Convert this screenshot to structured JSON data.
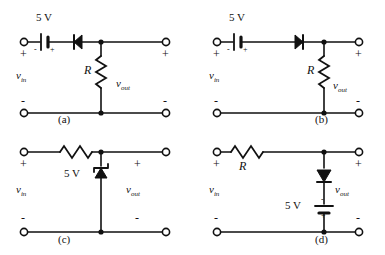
{
  "figure": {
    "title": "",
    "background_color": "#ffffff",
    "ink_color": "#111111",
    "panel_count": 4
  },
  "common_labels": {
    "v_in": "v",
    "v_in_sub": "in",
    "v_out": "v",
    "v_out_sub": "out",
    "resistor": "R",
    "source_value": "5 V",
    "plus": "+",
    "minus": "-",
    "battery_minus": "-",
    "battery_plus": "+"
  },
  "panels": [
    {
      "id": "a",
      "caption": "(a)",
      "source_label": "5 V",
      "resistor_label": "R",
      "input_label": "v",
      "input_sub": "in",
      "output_label": "v",
      "output_sub": "out",
      "input_plus": "+",
      "input_minus": "-",
      "output_plus": "+",
      "output_minus": "-",
      "battery_left_sign": "-",
      "battery_right_sign": "+",
      "elements": [
        "battery-series-horizontal",
        "diode-series-horizontal-pointing-left",
        "resistor-shunt-vertical"
      ]
    },
    {
      "id": "b",
      "caption": "(b)",
      "source_label": "5 V",
      "resistor_label": "R",
      "input_label": "v",
      "input_sub": "in",
      "output_label": "v",
      "output_sub": "out",
      "input_plus": "+",
      "input_minus": "-",
      "output_plus": "+",
      "output_minus": "-",
      "battery_left_sign": "-",
      "battery_right_sign": "+",
      "elements": [
        "battery-series-horizontal",
        "diode-series-horizontal-pointing-right",
        "resistor-shunt-vertical"
      ]
    },
    {
      "id": "c",
      "caption": "(c)",
      "source_label": "5 V",
      "resistor_label": "",
      "input_label": "v",
      "input_sub": "in",
      "output_label": "v",
      "output_sub": "out",
      "input_plus": "+",
      "input_minus": "-",
      "output_plus": "+",
      "output_minus": "-",
      "elements": [
        "resistor-series-horizontal",
        "zener-diode-shunt-vertical-pointing-up"
      ]
    },
    {
      "id": "d",
      "caption": "(d)",
      "source_label": "5 V",
      "resistor_label": "R",
      "input_label": "v",
      "input_sub": "in",
      "output_label": "v",
      "output_sub": "out",
      "input_plus": "+",
      "input_minus": "-",
      "output_plus": "+",
      "output_minus": "-",
      "battery_top_sign": "-",
      "battery_bottom_sign": "+",
      "elements": [
        "resistor-series-horizontal",
        "diode-shunt-vertical-pointing-down",
        "battery-shunt-vertical"
      ]
    }
  ]
}
